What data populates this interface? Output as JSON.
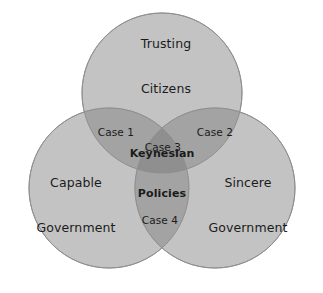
{
  "figure": {
    "type": "venn-diagram-3-set",
    "title": "",
    "background_color": "#ffffff",
    "canvas": {
      "width": 323,
      "height": 293
    }
  },
  "style": {
    "circle_fill": "#c3c3c3",
    "circle_stroke": "#9a9a9a",
    "overlap_two_fill": "#a3a3a3",
    "overlap_three_fill": "#8f8f8f",
    "text_color": "#1b1b1b"
  },
  "sets": [
    {
      "id": "trusting-citizens",
      "label_line1": "Trusting",
      "label_line2": "Citizens",
      "center": {
        "x": 162,
        "y": 93
      },
      "radius": 80,
      "label_pos": {
        "x": 166,
        "y": 66
      }
    },
    {
      "id": "capable-government",
      "label_line1": "Capable",
      "label_line2": "Government",
      "center": {
        "x": 109,
        "y": 188
      },
      "radius": 80,
      "label_pos": {
        "x": 76,
        "y": 205
      }
    },
    {
      "id": "sincere-government",
      "label_line1": "Sincere",
      "label_line2": "Government",
      "center": {
        "x": 215,
        "y": 188
      },
      "radius": 80,
      "label_pos": {
        "x": 248,
        "y": 205
      }
    }
  ],
  "regions": [
    {
      "id": "case-1",
      "label": "Case 1",
      "description": "Trusting Citizens ∩ Capable Government",
      "pos": {
        "x": 116,
        "y": 132
      }
    },
    {
      "id": "case-2",
      "label": "Case 2",
      "description": "Trusting Citizens ∩ Sincere Government",
      "pos": {
        "x": 215,
        "y": 132
      },
      "text_align": "left"
    },
    {
      "id": "case-3",
      "label": "Case 3",
      "description": "Trusting Citizens ∩ Capable Government ∩ Sincere Government",
      "pos": {
        "x": 163,
        "y": 147
      }
    },
    {
      "id": "keynesian-policies",
      "label_line1": "Keynesian",
      "label_line2": "Policies",
      "description": "Center of all three sets",
      "pos": {
        "x": 162,
        "y": 174
      },
      "emphasis": "bold"
    },
    {
      "id": "case-4",
      "label": "Case 4",
      "description": "Capable Government ∩ Sincere Government",
      "pos": {
        "x": 160,
        "y": 220
      }
    }
  ]
}
